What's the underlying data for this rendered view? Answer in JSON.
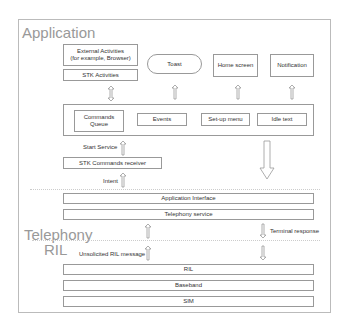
{
  "layers": {
    "application": "Application",
    "telephony": "Telephony",
    "ril": "RIL"
  },
  "application": {
    "external_activities": "External Activities\n(for example, Browser)",
    "external_line1": "External Activities",
    "external_line2": "(for example, Browser)",
    "stk_activities": "STK Activities",
    "toast": "Toast",
    "home_screen": "Home screen",
    "notification": "Notification",
    "commands_queue_line1": "Commands",
    "commands_queue_line2": "Queue",
    "events": "Events",
    "setup_menu": "Set-up menu",
    "idle_text": "Idle text",
    "start_service": "Start Service",
    "stk_commands_receiver": "STK Commands receiver",
    "intent": "Intent"
  },
  "telephony": {
    "application_interface": "Application Interface",
    "telephony_service": "Telephony service",
    "terminal_response": "Terminal response"
  },
  "ril": {
    "unsolicited_ril_message": "Unsolicited RIL message",
    "ril": "RIL",
    "baseband": "Baseband",
    "sim": "SIM"
  },
  "colors": {
    "frame": "#bbbbbb",
    "box_border": "#999999",
    "layer_text": "#999999",
    "text": "#333333"
  }
}
